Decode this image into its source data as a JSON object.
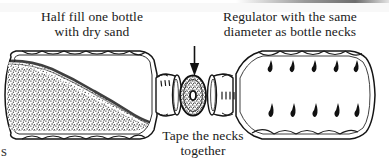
{
  "figure": {
    "type": "line-art-diagram",
    "width": 389,
    "height": 166,
    "background_color": "#ffffff",
    "ink_color": "#1a1a1a"
  },
  "captions": {
    "left": {
      "line1": "Half fill one bottle",
      "line2": "with dry sand"
    },
    "right": {
      "line1": "Regulator with the same",
      "line2": "diameter as bottle necks"
    },
    "bottom": {
      "line1": "Tape the necks",
      "line2": "together"
    }
  },
  "page_stray_text": "s",
  "parts": {
    "left_bottle": {
      "label": "bottle-filled-with-sand",
      "fill": "dry sand",
      "fill_level": "half",
      "orientation": "horizontal",
      "neck_side": "right",
      "neck_hatch_marks": 3,
      "body_ridges": 6
    },
    "right_bottle": {
      "label": "empty-bottle",
      "fill": "empty",
      "orientation": "horizontal",
      "neck_side": "left",
      "neck_hatch_marks": 4,
      "droplet_rows": 2,
      "droplets_per_row": 5,
      "body_ridges": 6
    },
    "regulator": {
      "label": "regulator-disc",
      "shape": "stippled ellipse with central hole",
      "note": "same diameter as bottle necks"
    },
    "arrow": {
      "label": "pointer-arrow",
      "direction": "down",
      "points_to": "regulator-disc"
    }
  }
}
